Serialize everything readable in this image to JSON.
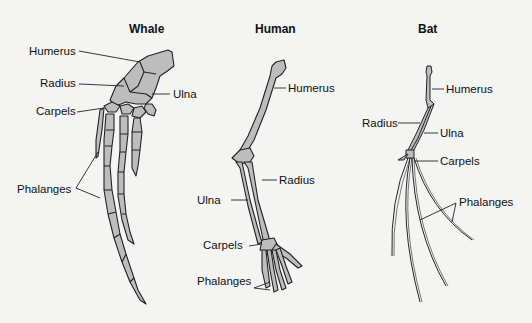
{
  "diagram": {
    "bone_fill": "#bdbdbd",
    "outline": "#222222",
    "panels": [
      {
        "title": "Whale",
        "labels": [
          "Humerus",
          "Radius",
          "Ulna",
          "Carpels",
          "Phalanges"
        ]
      },
      {
        "title": "Human",
        "labels": [
          "Humerus",
          "Radius",
          "Ulna",
          "Carpels",
          "Phalanges"
        ]
      },
      {
        "title": "Bat",
        "labels": [
          "Humerus",
          "Radius",
          "Ulna",
          "Carpels",
          "Phalanges"
        ]
      }
    ]
  }
}
